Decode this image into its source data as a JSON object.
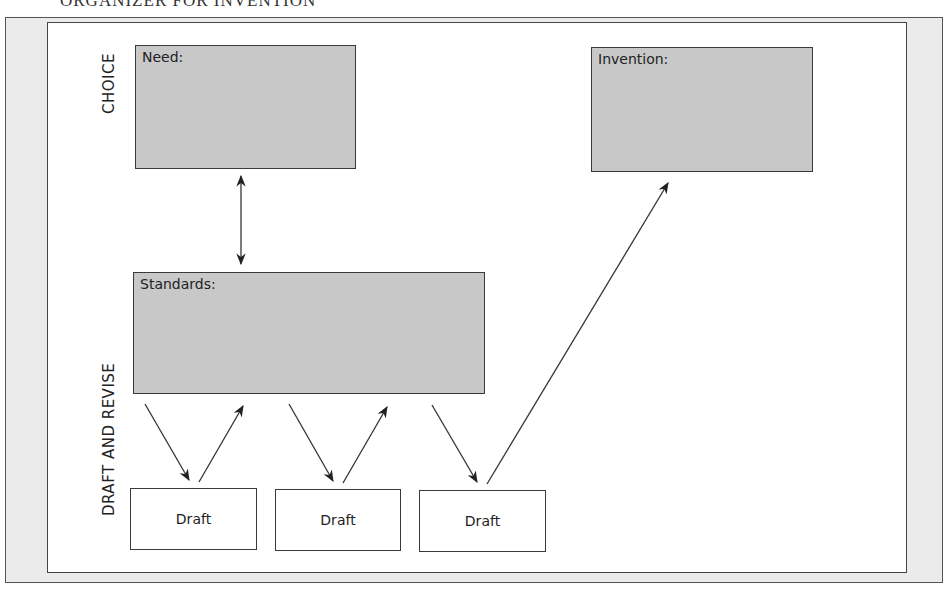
{
  "title": "ORGANIZER FOR INVENTION",
  "sections": {
    "choice": "CHOICE",
    "draft_and_revise": "DRAFT AND REVISE"
  },
  "boxes": {
    "need": {
      "label": "Need:",
      "fill": "#c8c8c8"
    },
    "standards": {
      "label": "Standards:",
      "fill": "#c8c8c8"
    },
    "invention": {
      "label": "Invention:",
      "fill": "#c8c8c8"
    },
    "drafts": [
      {
        "label": "Draft"
      },
      {
        "label": "Draft"
      },
      {
        "label": "Draft"
      }
    ]
  },
  "arrows": [
    {
      "from": "need",
      "to": "standards",
      "type": "bidirectional"
    },
    {
      "from": "standards",
      "to": "drafts.0"
    },
    {
      "from": "drafts.0",
      "to": "standards"
    },
    {
      "from": "standards",
      "to": "drafts.1"
    },
    {
      "from": "drafts.1",
      "to": "standards"
    },
    {
      "from": "standards",
      "to": "drafts.2"
    },
    {
      "from": "drafts.2",
      "to": "invention"
    }
  ],
  "colors": {
    "frame": "#ebebeb",
    "box_fill": "#c8c8c8",
    "stroke": "#3a3a3a"
  }
}
